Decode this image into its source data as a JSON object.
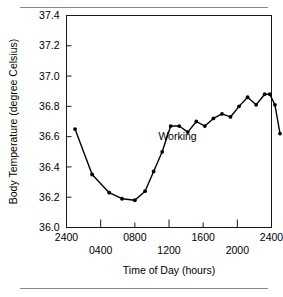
{
  "figure": {
    "background_color": "#ffffff",
    "rule_color": "#888888",
    "line_color": "#000000",
    "top_rule": "horizontal-rule",
    "bottom_rule": "horizontal-rule"
  },
  "chart_data": {
    "type": "line",
    "title": "",
    "xlabel": "Time of Day (hours)",
    "ylabel": "Body Temperature (degree Celsius)",
    "xlim": [
      2400,
      4800
    ],
    "ylim": [
      36.0,
      37.4
    ],
    "grid": false,
    "legend": "none",
    "marker": "filled-circle",
    "x_tick_labels": [
      "2400",
      "0400",
      "0800",
      "1200",
      "1600",
      "2000",
      "2400"
    ],
    "x_tick_values": [
      2400,
      2800,
      3200,
      3600,
      4000,
      4400,
      4800
    ],
    "y_tick_labels": [
      "36.0",
      "36.2",
      "36.4",
      "36.6",
      "36.8",
      "37.0",
      "37.2",
      "37.4"
    ],
    "y_tick_values": [
      36.0,
      36.2,
      36.4,
      36.6,
      36.8,
      37.0,
      37.2,
      37.4
    ],
    "annotations": [
      {
        "text": "Working",
        "x": 3700,
        "y": 36.58
      }
    ],
    "series": [
      {
        "name": "Body temperature",
        "x": [
          2500,
          2700,
          2900,
          3050,
          3200,
          3320,
          3420,
          3520,
          3620,
          3720,
          3820,
          3920,
          4020,
          4120,
          4220,
          4320,
          4420,
          4520,
          4620,
          4720
        ],
        "values": [
          36.65,
          36.35,
          36.23,
          36.19,
          36.18,
          36.24,
          36.37,
          36.5,
          36.67,
          36.67,
          36.63,
          36.7,
          36.67,
          36.72,
          36.75,
          36.73,
          36.8,
          36.86,
          36.81,
          36.88
        ],
        "x_hours": [
          "2400",
          "0130",
          "0300",
          "0415",
          "0600",
          "0720",
          "0830",
          "0930",
          "1030",
          "1130",
          "1230",
          "1330",
          "1430",
          "1530",
          "1630",
          "1730",
          "1830",
          "1930",
          "2030",
          "2130"
        ]
      }
    ],
    "series_tail": {
      "x": [
        4780,
        4840,
        4900
      ],
      "values": [
        36.88,
        36.81,
        36.62
      ]
    }
  }
}
